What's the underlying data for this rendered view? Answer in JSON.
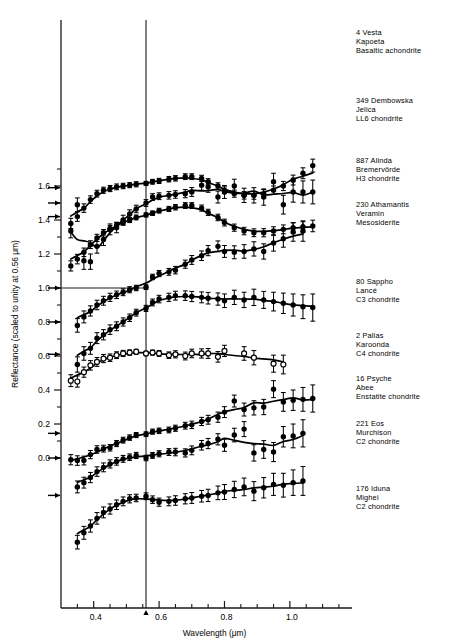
{
  "figure": {
    "title": "",
    "x_axis_label": "Wavelength  (μm)",
    "y_axis_label": "Reflectance (scaled to unity at 0.56 μm)"
  },
  "chart_data": {
    "type": "line",
    "title": "",
    "xlabel": "Wavelength  (μm)",
    "ylabel": "Reflectance (scaled to unity at 0.56 μm)",
    "xlim": [
      0.3,
      1.19
    ],
    "ylim": [
      -0.5,
      1.85
    ],
    "xticks": [
      0.4,
      0.6,
      0.8,
      1.0
    ],
    "xticklabels": [
      "0.4",
      "0.6",
      "0.8",
      "1.0"
    ],
    "xminorticks": [
      0.35,
      0.45,
      0.5,
      0.55,
      0.65,
      0.7,
      0.75,
      0.85,
      0.9,
      0.95,
      1.05,
      1.1,
      1.15
    ],
    "yticks": [
      0.0,
      0.2,
      0.4,
      0.6,
      0.8,
      1.0,
      1.2,
      1.4,
      1.6
    ],
    "yticklabels": [
      "0.0",
      "0.2",
      "0.4",
      "0.6",
      "0.8",
      "1.0",
      "1.2",
      "1.4",
      "1.6"
    ],
    "yminorticks": [
      0.1,
      0.3,
      0.5,
      0.7,
      0.9,
      1.1,
      1.3,
      1.5,
      1.7
    ],
    "grid": false,
    "legend_position": "right-inline",
    "reference_line_x": 0.56,
    "reference_line_y": 1.0,
    "unity_arrow_note": "Each spectrum normalized to unity at 0.56 μm; arrows on the left axis mark the unity level of each offset spectrum.",
    "series": [
      {
        "name": "4 Vesta",
        "meteorite": "Kapoeta",
        "class": "Basaltic achondrite",
        "marker": "filled-circle",
        "unity_level": 1.59,
        "x": [
          0.33,
          0.35,
          0.37,
          0.39,
          0.41,
          0.43,
          0.45,
          0.47,
          0.49,
          0.51,
          0.53,
          0.56,
          0.58,
          0.6,
          0.63,
          0.65,
          0.68,
          0.7,
          0.73,
          0.75,
          0.78,
          0.8,
          0.83,
          0.86,
          0.89,
          0.92,
          0.95,
          0.98,
          1.01,
          1.04,
          1.07
        ],
        "y": [
          1.38,
          1.42,
          1.47,
          1.52,
          1.555,
          1.575,
          1.585,
          1.595,
          1.6,
          1.605,
          1.61,
          1.615,
          1.625,
          1.63,
          1.64,
          1.645,
          1.655,
          1.655,
          1.645,
          1.625,
          1.6,
          1.575,
          1.555,
          1.545,
          1.545,
          1.555,
          1.575,
          1.6,
          1.635,
          1.675,
          1.72
        ],
        "yerr": [
          0.03,
          0.028,
          0.025,
          0.022,
          0.02,
          0.018,
          0.018,
          0.017,
          0.016,
          0.015,
          0.015,
          0.012,
          0.014,
          0.015,
          0.016,
          0.016,
          0.017,
          0.017,
          0.018,
          0.018,
          0.019,
          0.02,
          0.021,
          0.022,
          0.023,
          0.024,
          0.025,
          0.027,
          0.029,
          0.032,
          0.038
        ]
      },
      {
        "name": "349 Dembowska",
        "meteorite": "Jelica",
        "class": "LL6 chondrite",
        "marker": "filled-circle",
        "unity_level": 1.42,
        "x": [
          0.33,
          0.35,
          0.37,
          0.39,
          0.41,
          0.43,
          0.45,
          0.47,
          0.49,
          0.51,
          0.53,
          0.56,
          0.58,
          0.6,
          0.63,
          0.65,
          0.68,
          0.7,
          0.73,
          0.75,
          0.78,
          0.8,
          0.83,
          0.86,
          0.89,
          0.92,
          0.95,
          0.98,
          1.01,
          1.04,
          1.07
        ],
        "y": [
          1.13,
          1.17,
          1.21,
          1.255,
          1.295,
          1.325,
          1.35,
          1.37,
          1.385,
          1.4,
          1.415,
          1.43,
          1.44,
          1.455,
          1.465,
          1.475,
          1.485,
          1.485,
          1.47,
          1.445,
          1.415,
          1.385,
          1.355,
          1.335,
          1.325,
          1.325,
          1.335,
          1.345,
          1.355,
          1.36,
          1.365
        ],
        "yerr": [
          0.03,
          0.028,
          0.025,
          0.023,
          0.021,
          0.019,
          0.018,
          0.017,
          0.016,
          0.015,
          0.014,
          0.012,
          0.013,
          0.014,
          0.015,
          0.016,
          0.017,
          0.017,
          0.018,
          0.018,
          0.019,
          0.02,
          0.021,
          0.022,
          0.023,
          0.024,
          0.025,
          0.026,
          0.028,
          0.03,
          0.034
        ]
      },
      {
        "name": "887 Alinda",
        "meteorite": "Bremervörde",
        "class": "H3 chondrite",
        "marker": "filled-circle",
        "unity_level": 1.5,
        "x": [
          0.33,
          0.35,
          0.37,
          0.39,
          0.41,
          0.43,
          0.45,
          0.47,
          0.49,
          0.51,
          0.53,
          0.56,
          0.58,
          0.6,
          0.63,
          0.65,
          0.68,
          0.7,
          0.73,
          0.75,
          0.78,
          0.8,
          0.83,
          0.86,
          0.89,
          0.92,
          0.95,
          0.98,
          1.01,
          1.04,
          1.07
        ],
        "y": [
          1.335,
          1.49,
          1.16,
          1.155,
          1.245,
          1.285,
          1.345,
          1.355,
          1.4,
          1.435,
          1.465,
          1.5,
          1.535,
          1.54,
          1.545,
          1.55,
          1.555,
          1.565,
          1.605,
          1.595,
          1.535,
          1.565,
          1.6,
          1.545,
          1.545,
          1.535,
          1.625,
          1.49,
          1.565,
          1.565,
          1.565
        ],
        "yerr": [
          0.04,
          0.04,
          0.05,
          0.045,
          0.04,
          0.035,
          0.032,
          0.03,
          0.028,
          0.025,
          0.022,
          0.02,
          0.02,
          0.02,
          0.022,
          0.022,
          0.024,
          0.026,
          0.03,
          0.032,
          0.035,
          0.038,
          0.04,
          0.042,
          0.045,
          0.048,
          0.05,
          0.055,
          0.06,
          0.065,
          0.07
        ]
      },
      {
        "name": "230 Athamantis",
        "meteorite": "Veramin",
        "class": "Mesosiderite",
        "marker": "filled-circle",
        "unity_level": 1.0,
        "x": [
          0.35,
          0.37,
          0.39,
          0.41,
          0.43,
          0.45,
          0.47,
          0.49,
          0.51,
          0.53,
          0.56,
          0.58,
          0.6,
          0.63,
          0.65,
          0.68,
          0.7,
          0.73,
          0.75,
          0.78,
          0.8,
          0.83,
          0.86,
          0.89,
          0.92,
          0.95,
          0.98,
          1.01,
          1.04
        ],
        "y": [
          0.78,
          0.83,
          0.865,
          0.9,
          0.925,
          0.945,
          0.96,
          0.975,
          0.99,
          1.0,
          1.005,
          1.065,
          1.085,
          1.095,
          1.105,
          1.14,
          1.165,
          1.19,
          1.22,
          1.245,
          1.215,
          1.21,
          1.215,
          1.23,
          1.215,
          1.265,
          1.29,
          1.33,
          1.335
        ],
        "yerr": [
          0.04,
          0.035,
          0.03,
          0.028,
          0.026,
          0.024,
          0.022,
          0.02,
          0.018,
          0.016,
          0.014,
          0.016,
          0.018,
          0.02,
          0.022,
          0.024,
          0.026,
          0.028,
          0.03,
          0.032,
          0.035,
          0.038,
          0.04,
          0.042,
          0.045,
          0.048,
          0.05,
          0.055,
          0.06
        ]
      },
      {
        "name": "80 Sappho",
        "meteorite": "Lancé",
        "class": "C3 chondrite",
        "marker": "filled-circle",
        "unity_level": 0.8,
        "x": [
          0.35,
          0.37,
          0.39,
          0.41,
          0.43,
          0.45,
          0.47,
          0.49,
          0.51,
          0.53,
          0.56,
          0.58,
          0.6,
          0.63,
          0.65,
          0.68,
          0.7,
          0.73,
          0.75,
          0.78,
          0.8,
          0.83,
          0.86,
          0.89,
          0.92,
          0.95,
          0.98,
          1.01,
          1.04,
          1.07
        ],
        "y": [
          0.55,
          0.615,
          0.645,
          0.705,
          0.725,
          0.755,
          0.775,
          0.8,
          0.825,
          0.855,
          0.88,
          0.915,
          0.935,
          0.945,
          0.955,
          0.955,
          0.95,
          0.945,
          0.94,
          0.935,
          0.925,
          0.945,
          0.93,
          0.945,
          0.93,
          0.92,
          0.91,
          0.9,
          0.89,
          0.885
        ],
        "yerr": [
          0.045,
          0.04,
          0.035,
          0.032,
          0.03,
          0.028,
          0.026,
          0.024,
          0.022,
          0.02,
          0.018,
          0.02,
          0.022,
          0.024,
          0.026,
          0.028,
          0.03,
          0.032,
          0.034,
          0.036,
          0.04,
          0.042,
          0.045,
          0.048,
          0.05,
          0.055,
          0.06,
          0.065,
          0.07,
          0.08
        ]
      },
      {
        "name": "2 Pallas",
        "meteorite": "Karoonda",
        "class": "C4 chondrite",
        "marker": "open-circle",
        "unity_level": 0.61,
        "x": [
          0.33,
          0.35,
          0.37,
          0.39,
          0.41,
          0.43,
          0.45,
          0.47,
          0.49,
          0.51,
          0.53,
          0.56,
          0.58,
          0.6,
          0.63,
          0.65,
          0.68,
          0.7,
          0.73,
          0.75,
          0.78,
          0.8,
          0.86,
          0.89,
          0.95,
          0.98
        ],
        "y": [
          0.455,
          0.45,
          0.505,
          0.545,
          0.565,
          0.585,
          0.59,
          0.605,
          0.615,
          0.62,
          0.625,
          0.615,
          0.62,
          0.615,
          0.605,
          0.61,
          0.6,
          0.615,
          0.615,
          0.615,
          0.595,
          0.63,
          0.615,
          0.59,
          0.555,
          0.55
        ],
        "yerr": [
          0.035,
          0.033,
          0.03,
          0.028,
          0.026,
          0.024,
          0.022,
          0.02,
          0.018,
          0.016,
          0.015,
          0.013,
          0.015,
          0.017,
          0.019,
          0.021,
          0.023,
          0.025,
          0.027,
          0.029,
          0.031,
          0.033,
          0.04,
          0.042,
          0.05,
          0.055
        ]
      },
      {
        "name": "16 Psyche",
        "meteorite": "Abee",
        "class": "Enstatite chondrite",
        "marker": "filled-circle",
        "unity_level": 0.145,
        "x": [
          0.33,
          0.35,
          0.37,
          0.39,
          0.41,
          0.43,
          0.45,
          0.47,
          0.49,
          0.51,
          0.53,
          0.56,
          0.58,
          0.6,
          0.63,
          0.65,
          0.68,
          0.7,
          0.73,
          0.75,
          0.78,
          0.8,
          0.83,
          0.86,
          0.89,
          0.92,
          0.95,
          0.98,
          1.01,
          1.04,
          1.07
        ],
        "y": [
          -0.01,
          -0.015,
          -0.015,
          0.02,
          0.05,
          0.055,
          0.06,
          0.085,
          0.105,
          0.12,
          0.135,
          0.14,
          0.155,
          0.16,
          0.165,
          0.175,
          0.19,
          0.195,
          0.215,
          0.225,
          0.24,
          0.27,
          0.335,
          0.285,
          0.295,
          0.3,
          0.405,
          0.33,
          0.34,
          0.345,
          0.35
        ],
        "yerr": [
          0.03,
          0.028,
          0.026,
          0.024,
          0.022,
          0.02,
          0.019,
          0.018,
          0.017,
          0.016,
          0.015,
          0.014,
          0.015,
          0.016,
          0.017,
          0.018,
          0.02,
          0.022,
          0.024,
          0.026,
          0.03,
          0.032,
          0.035,
          0.038,
          0.042,
          0.045,
          0.05,
          0.055,
          0.06,
          0.07,
          0.08
        ]
      },
      {
        "name": "221 Eos",
        "meteorite": "Murchison",
        "class": "C2 chondrite",
        "marker": "filled-circle",
        "unity_level": 0.0,
        "x": [
          0.35,
          0.37,
          0.39,
          0.41,
          0.43,
          0.45,
          0.47,
          0.49,
          0.51,
          0.53,
          0.56,
          0.58,
          0.6,
          0.63,
          0.65,
          0.68,
          0.7,
          0.73,
          0.75,
          0.78,
          0.8,
          0.83,
          0.86,
          0.89,
          0.92,
          0.95,
          0.98,
          1.01,
          1.04
        ],
        "y": [
          -0.17,
          -0.145,
          -0.115,
          -0.08,
          -0.055,
          -0.035,
          -0.02,
          -0.005,
          0.005,
          0.015,
          0.0,
          0.015,
          0.025,
          0.035,
          0.035,
          0.03,
          0.045,
          0.075,
          0.085,
          0.11,
          0.075,
          0.135,
          0.17,
          0.03,
          0.05,
          0.035,
          0.125,
          0.13,
          0.145
        ],
        "yerr": [
          0.035,
          0.032,
          0.03,
          0.028,
          0.026,
          0.024,
          0.022,
          0.02,
          0.019,
          0.018,
          0.016,
          0.017,
          0.018,
          0.02,
          0.022,
          0.024,
          0.026,
          0.028,
          0.03,
          0.033,
          0.036,
          0.04,
          0.044,
          0.048,
          0.052,
          0.056,
          0.06,
          0.07,
          0.08
        ]
      },
      {
        "name": "176 Iduna",
        "meteorite": "Mighei",
        "class": "C2 chondrite",
        "marker": "filled-circle",
        "unity_level": -0.22,
        "x": [
          0.35,
          0.37,
          0.39,
          0.41,
          0.43,
          0.45,
          0.47,
          0.49,
          0.51,
          0.53,
          0.56,
          0.58,
          0.6,
          0.63,
          0.65,
          0.68,
          0.7,
          0.73,
          0.75,
          0.78,
          0.8,
          0.83,
          0.86,
          0.89,
          0.92,
          0.95,
          0.98,
          1.01,
          1.04
        ],
        "y": [
          -0.495,
          -0.44,
          -0.4,
          -0.355,
          -0.32,
          -0.3,
          -0.275,
          -0.255,
          -0.24,
          -0.235,
          -0.225,
          -0.245,
          -0.26,
          -0.255,
          -0.25,
          -0.24,
          -0.235,
          -0.225,
          -0.22,
          -0.205,
          -0.2,
          -0.185,
          -0.17,
          -0.195,
          -0.175,
          -0.155,
          -0.16,
          -0.145,
          -0.135
        ],
        "yerr": [
          0.04,
          0.038,
          0.036,
          0.034,
          0.032,
          0.03,
          0.028,
          0.026,
          0.024,
          0.022,
          0.02,
          0.022,
          0.024,
          0.026,
          0.028,
          0.03,
          0.032,
          0.034,
          0.036,
          0.04,
          0.044,
          0.048,
          0.052,
          0.056,
          0.06,
          0.065,
          0.07,
          0.075,
          0.085
        ]
      }
    ]
  },
  "legend": [
    {
      "id": "vesta",
      "line1": "4 Vesta",
      "line2": "Kapoeta",
      "line3": "Basaltic achondrite"
    },
    {
      "id": "dembowska",
      "line1": "349 Dembowska",
      "line2": "Jelica",
      "line3": "LL6 chondrite"
    },
    {
      "id": "alinda",
      "line1": "887 Alinda",
      "line2": "Bremervörde",
      "line3": "H3 chondrite"
    },
    {
      "id": "athamantis",
      "line1": "230 Athamantis",
      "line2": "Veramin",
      "line3": "Mesosiderite"
    },
    {
      "id": "sappho",
      "line1": "80 Sappho",
      "line2": "Lancé",
      "line3": "C3 chondrite"
    },
    {
      "id": "pallas",
      "line1": "2 Pallas",
      "line2": "Karoonda",
      "line3": "C4 chondrite"
    },
    {
      "id": "psyche",
      "line1": "16 Psyche",
      "line2": "Abee",
      "line3": "Enstatite chondrite"
    },
    {
      "id": "eos",
      "line1": "221 Eos",
      "line2": "Murchison",
      "line3": "C2 chondrite"
    },
    {
      "id": "iduna",
      "line1": "176 Iduna",
      "line2": "Mighei",
      "line3": "C2 chondrite"
    }
  ]
}
